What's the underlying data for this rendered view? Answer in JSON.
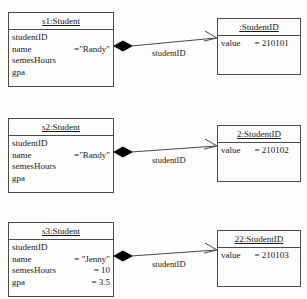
{
  "diagram": {
    "type": "uml-object-diagram",
    "background_color": "#fdfdfb",
    "line_color": "#4a4a4a",
    "diamond_color": "#000000",
    "rows": [
      {
        "student": {
          "title": "s1:Student",
          "attributes": [
            {
              "name": "studentID",
              "value": ""
            },
            {
              "name": "name",
              "value": "=\"Randy\""
            },
            {
              "name": "semesHours",
              "value": ""
            },
            {
              "name": "gpa",
              "value": ""
            }
          ]
        },
        "link_label": "studentID",
        "studentid": {
          "title": ":StudentID",
          "attributes": [
            {
              "name": "value",
              "value": "= 210101"
            }
          ]
        }
      },
      {
        "student": {
          "title": "s2:Student",
          "attributes": [
            {
              "name": "studentID",
              "value": ""
            },
            {
              "name": "name",
              "value": "=\"Randy\""
            },
            {
              "name": "semesHours",
              "value": ""
            },
            {
              "name": "gpa",
              "value": ""
            }
          ]
        },
        "link_label": "studentID",
        "studentid": {
          "title": "2:StudentID",
          "attributes": [
            {
              "name": "value",
              "value": "= 210102"
            }
          ]
        }
      },
      {
        "student": {
          "title": "s3:Student",
          "attributes": [
            {
              "name": "studentID",
              "value": ""
            },
            {
              "name": "name",
              "value": "= \"Jenny\""
            },
            {
              "name": "semesHours",
              "value": "= 10"
            },
            {
              "name": "gpa",
              "value": "= 3.5"
            }
          ]
        },
        "link_label": "studentID",
        "studentid": {
          "title": "22:StudentID",
          "attributes": [
            {
              "name": "value",
              "value": "= 210103"
            }
          ]
        }
      }
    ]
  }
}
